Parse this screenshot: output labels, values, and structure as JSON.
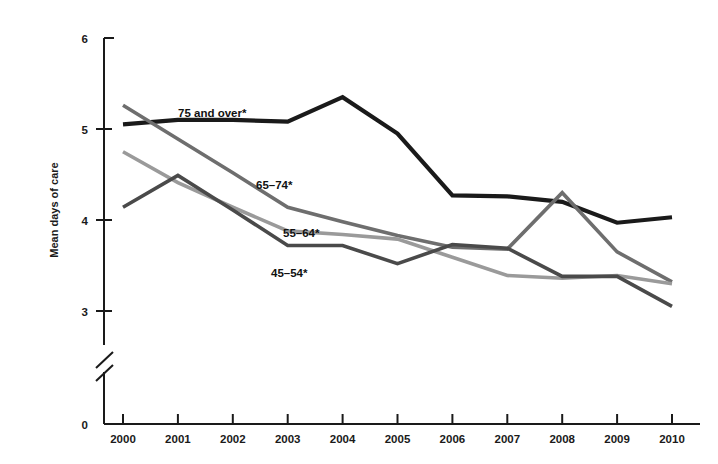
{
  "chart_data": {
    "type": "line",
    "title": "",
    "subtitle": "",
    "xlabel": "",
    "ylabel": "Mean days of care",
    "x": [
      2000,
      2001,
      2002,
      2003,
      2004,
      2005,
      2006,
      2007,
      2008,
      2009,
      2010
    ],
    "xtick_labels": [
      "2000",
      "2001",
      "2002",
      "2003",
      "2004",
      "2005",
      "2006",
      "2007",
      "2008",
      "2009",
      "2010"
    ],
    "ytick_labels": [
      "0",
      "3",
      "4",
      "5",
      "6"
    ],
    "ytick_values": [
      0,
      3,
      4,
      5,
      6
    ],
    "ylim": [
      3,
      6
    ],
    "axis_break": true,
    "axis_break_note": "y-axis broken between 0 and 3",
    "grid": false,
    "legend_position": "inline-labels",
    "series": [
      {
        "name": "75 and over*",
        "label": "75 and over*",
        "color": "#1a1a1a",
        "values": [
          5.05,
          5.1,
          5.1,
          5.08,
          5.35,
          4.95,
          4.27,
          4.26,
          4.2,
          3.97,
          4.03
        ]
      },
      {
        "name": "65–74*",
        "label": "65–74*",
        "color": "#6e6e6e",
        "values": [
          5.26,
          4.89,
          4.52,
          4.14,
          3.98,
          3.83,
          3.7,
          3.68,
          4.3,
          3.65,
          3.32
        ]
      },
      {
        "name": "55–64*",
        "label": "55–64*",
        "color": "#9a9a9a",
        "values": [
          4.75,
          4.41,
          4.14,
          3.88,
          3.84,
          3.79,
          3.59,
          3.39,
          3.36,
          3.39,
          3.3
        ]
      },
      {
        "name": "45–54*",
        "label": "45–54*",
        "color": "#4a4a4a",
        "values": [
          4.14,
          4.49,
          4.11,
          3.72,
          3.72,
          3.52,
          3.73,
          3.69,
          3.38,
          3.38,
          3.05
        ]
      }
    ]
  },
  "axis": {
    "y_title": "Mean days of care",
    "zero_label": "0"
  },
  "series_labels": [
    {
      "text": "75 and over*",
      "x": 178,
      "y": 117
    },
    {
      "text": "65–74*",
      "x": 256,
      "y": 189
    },
    {
      "text": "55–64*",
      "x": 283,
      "y": 237
    },
    {
      "text": "45–54*",
      "x": 271,
      "y": 277
    }
  ],
  "colors": {
    "axis": "#1a1a1a",
    "background": "#ffffff",
    "series_75_and_over": "#1a1a1a",
    "series_65_74": "#6e6e6e",
    "series_55_64": "#9a9a9a",
    "series_45_54": "#4a4a4a"
  }
}
